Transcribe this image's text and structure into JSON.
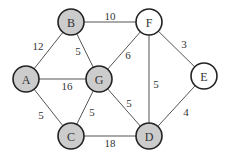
{
  "diagram": {
    "type": "weighted-undirected-graph",
    "colors": {
      "visited_fill": "#cccccc",
      "unvisited_fill": "#ffffff",
      "stroke": "#222222",
      "edge": "#555555"
    },
    "nodes": [
      {
        "id": "A",
        "label": "A",
        "x": 26,
        "y": 79,
        "shaded": true
      },
      {
        "id": "B",
        "label": "B",
        "x": 71,
        "y": 22,
        "shaded": true
      },
      {
        "id": "G",
        "label": "G",
        "x": 99,
        "y": 79,
        "shaded": true
      },
      {
        "id": "C",
        "label": "C",
        "x": 71,
        "y": 136,
        "shaded": true
      },
      {
        "id": "F",
        "label": "F",
        "x": 149,
        "y": 22,
        "shaded": false
      },
      {
        "id": "E",
        "label": "E",
        "x": 204,
        "y": 76,
        "shaded": false
      },
      {
        "id": "D",
        "label": "D",
        "x": 149,
        "y": 136,
        "shaded": true
      }
    ],
    "edges": [
      {
        "from": "A",
        "to": "B",
        "weight": "12",
        "lx": 38,
        "ly": 46
      },
      {
        "from": "A",
        "to": "G",
        "weight": "16",
        "lx": 67,
        "ly": 86
      },
      {
        "from": "A",
        "to": "C",
        "weight": "5",
        "lx": 41,
        "ly": 115
      },
      {
        "from": "B",
        "to": "G",
        "weight": "5",
        "lx": 78,
        "ly": 51
      },
      {
        "from": "B",
        "to": "F",
        "weight": "10",
        "lx": 110,
        "ly": 16
      },
      {
        "from": "G",
        "to": "F",
        "weight": "6",
        "lx": 128,
        "ly": 55
      },
      {
        "from": "G",
        "to": "C",
        "weight": "5",
        "lx": 92,
        "ly": 112
      },
      {
        "from": "G",
        "to": "D",
        "weight": "5",
        "lx": 129,
        "ly": 103
      },
      {
        "from": "F",
        "to": "D",
        "weight": "5",
        "lx": 156,
        "ly": 84
      },
      {
        "from": "F",
        "to": "E",
        "weight": "3",
        "lx": 184,
        "ly": 44
      },
      {
        "from": "E",
        "to": "D",
        "weight": "4",
        "lx": 186,
        "ly": 112
      },
      {
        "from": "C",
        "to": "D",
        "weight": "18",
        "lx": 110,
        "ly": 143
      }
    ]
  }
}
